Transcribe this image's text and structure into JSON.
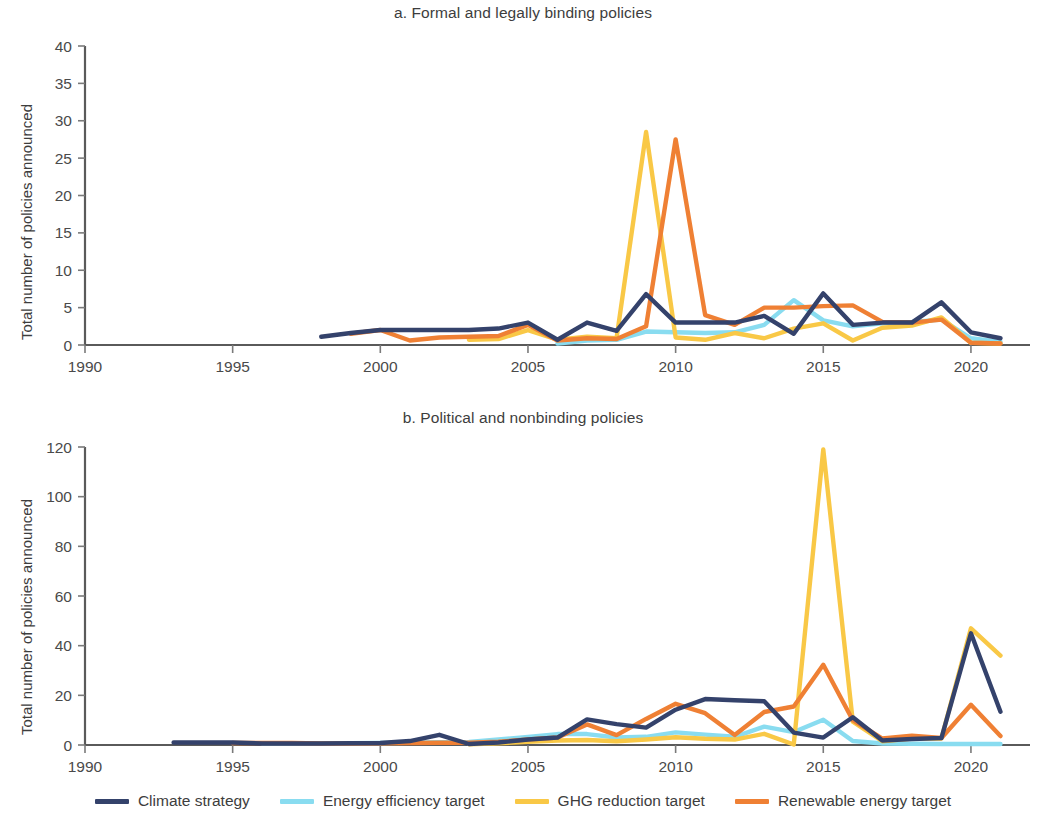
{
  "figure": {
    "ylabel": "Total number of policies announced",
    "xlabel": ""
  },
  "legend": {
    "position": "bottom-center",
    "items": [
      {
        "label": "Climate strategy",
        "color": "#34426b"
      },
      {
        "label": "Energy efficiency target",
        "color": "#89dcf0"
      },
      {
        "label": "GHG reduction target",
        "color": "#f9c846"
      },
      {
        "label": "Renewable energy target",
        "color": "#ef8034"
      }
    ]
  },
  "chart_data": [
    {
      "id": "panel-a",
      "type": "line",
      "title": "a. Formal and legally binding policies",
      "xlabel": "",
      "ylabel": "Total number of policies announced",
      "xlim": [
        1990,
        2022
      ],
      "ylim": [
        0,
        40
      ],
      "xticks": [
        1990,
        1995,
        2000,
        2005,
        2010,
        2015,
        2020
      ],
      "yticks": [
        0,
        5,
        10,
        15,
        20,
        25,
        30,
        35,
        40
      ],
      "grid": false,
      "series": [
        {
          "name": "Climate strategy",
          "color": "#34426b",
          "x": [
            1998,
            1999,
            2000,
            2001,
            2002,
            2003,
            2004,
            2005,
            2006,
            2007,
            2008,
            2009,
            2010,
            2011,
            2012,
            2013,
            2014,
            2015,
            2016,
            2017,
            2018,
            2019,
            2020,
            2021
          ],
          "values": [
            1.1,
            1.6,
            2.0,
            2.0,
            2.0,
            2.0,
            2.2,
            3.0,
            0.7,
            3.0,
            1.9,
            6.8,
            3.0,
            3.0,
            3.0,
            3.9,
            1.5,
            6.9,
            2.7,
            3.0,
            3.0,
            5.7,
            1.7,
            0.9
          ]
        },
        {
          "name": "Energy efficiency target",
          "color": "#89dcf0",
          "x": [
            2006,
            2007,
            2008,
            2009,
            2010,
            2011,
            2012,
            2013,
            2014,
            2015,
            2016,
            2017,
            2018,
            2019,
            2020,
            2021
          ],
          "values": [
            0.2,
            0.6,
            0.7,
            1.8,
            1.7,
            1.6,
            1.7,
            2.7,
            6.0,
            3.3,
            2.5,
            2.9,
            3.1,
            3.4,
            0.9,
            0.4
          ]
        },
        {
          "name": "GHG reduction target",
          "color": "#f9c846",
          "x": [
            2003,
            2004,
            2005,
            2006,
            2007,
            2008,
            2009,
            2010,
            2011,
            2012,
            2013,
            2014,
            2015,
            2016,
            2017,
            2018,
            2019,
            2020,
            2021
          ],
          "values": [
            0.7,
            0.8,
            2.0,
            0.7,
            1.1,
            0.9,
            28.5,
            1.0,
            0.7,
            1.6,
            0.9,
            2.2,
            2.9,
            0.6,
            2.3,
            2.6,
            3.7,
            0.3,
            0.2
          ]
        },
        {
          "name": "Renewable energy target",
          "color": "#ef8034",
          "x": [
            1999,
            2000,
            2001,
            2002,
            2003,
            2004,
            2005,
            2006,
            2007,
            2008,
            2009,
            2010,
            2011,
            2012,
            2013,
            2014,
            2015,
            2016,
            2017,
            2018,
            2019,
            2020,
            2021
          ],
          "values": [
            1.5,
            2.0,
            0.6,
            1.0,
            1.1,
            1.2,
            2.7,
            0.6,
            0.9,
            0.8,
            2.5,
            27.5,
            4.0,
            2.7,
            5.0,
            5.0,
            5.2,
            5.3,
            3.1,
            3.0,
            3.4,
            0.3,
            0.2
          ]
        }
      ]
    },
    {
      "id": "panel-b",
      "type": "line",
      "title": "b. Political and nonbinding policies",
      "xlabel": "",
      "ylabel": "Total number of policies announced",
      "xlim": [
        1990,
        2022
      ],
      "ylim": [
        0,
        120
      ],
      "xticks": [
        1990,
        1995,
        2000,
        2005,
        2010,
        2015,
        2020
      ],
      "yticks": [
        0,
        20,
        40,
        60,
        80,
        100,
        120
      ],
      "grid": false,
      "series": [
        {
          "name": "Climate strategy",
          "color": "#34426b",
          "x": [
            1993,
            1994,
            1995,
            1996,
            1997,
            1998,
            1999,
            2000,
            2001,
            2002,
            2003,
            2004,
            2005,
            2006,
            2007,
            2008,
            2009,
            2010,
            2011,
            2012,
            2013,
            2014,
            2015,
            2016,
            2017,
            2018,
            2019,
            2020,
            2021
          ],
          "values": [
            1.0,
            1.0,
            1.0,
            0.6,
            0.6,
            0.6,
            0.7,
            0.8,
            1.6,
            4.1,
            0.4,
            1.0,
            2.2,
            3.0,
            10.3,
            8.4,
            7.0,
            14.2,
            18.5,
            18.0,
            17.6,
            5.0,
            3.0,
            11.2,
            1.8,
            2.4,
            2.8,
            45.0,
            13.4
          ]
        },
        {
          "name": "Energy efficiency target",
          "color": "#89dcf0",
          "x": [
            1996,
            1997,
            1998,
            1999,
            2000,
            2001,
            2002,
            2003,
            2004,
            2005,
            2006,
            2007,
            2008,
            2009,
            2010,
            2011,
            2012,
            2013,
            2014,
            2015,
            2016,
            2017,
            2018,
            2019,
            2020,
            2021
          ],
          "values": [
            0.6,
            0.6,
            0.6,
            0.7,
            0.8,
            0.9,
            1.1,
            1.2,
            2.2,
            3.2,
            4.4,
            4.4,
            3.0,
            3.3,
            5.1,
            4.2,
            3.3,
            7.4,
            5.2,
            10.2,
            1.6,
            0.6,
            0.5,
            0.4,
            0.4,
            0.4
          ]
        },
        {
          "name": "GHG reduction target",
          "color": "#f9c846",
          "x": [
            2003,
            2004,
            2005,
            2006,
            2007,
            2008,
            2009,
            2010,
            2011,
            2012,
            2013,
            2014,
            2015,
            2016,
            2017,
            2018,
            2019,
            2020,
            2021
          ],
          "values": [
            0.3,
            0.7,
            1.3,
            1.8,
            2.0,
            1.5,
            2.2,
            3.1,
            2.5,
            2.2,
            4.5,
            0.2,
            119.0,
            9.4,
            1.5,
            2.6,
            2.6,
            47.0,
            36.0
          ]
        },
        {
          "name": "Renewable energy target",
          "color": "#ef8034",
          "x": [
            1995,
            1996,
            1997,
            1998,
            1999,
            2000,
            2001,
            2002,
            2003,
            2004,
            2005,
            2006,
            2007,
            2008,
            2009,
            2010,
            2011,
            2012,
            2013,
            2014,
            2015,
            2016,
            2017,
            2018,
            2019,
            2020,
            2021
          ],
          "values": [
            0.8,
            0.8,
            0.8,
            0.6,
            0.6,
            0.7,
            0.8,
            0.9,
            0.9,
            1.3,
            2.2,
            3.0,
            8.3,
            4.0,
            10.5,
            16.6,
            12.8,
            4.0,
            13.3,
            15.5,
            32.3,
            10.0,
            2.6,
            3.7,
            2.8,
            16.2,
            3.6
          ]
        }
      ]
    }
  ]
}
